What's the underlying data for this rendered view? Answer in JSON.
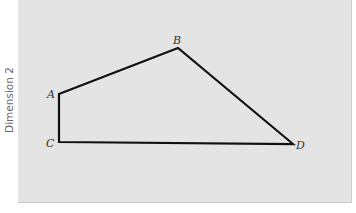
{
  "diagram": {
    "y_axis_label": "Dimension 2",
    "stroke_color": "#111111",
    "panel_color": "#e4e4e4",
    "points": [
      {
        "id": "A",
        "label": "A",
        "x": 59,
        "y": 94
      },
      {
        "id": "B",
        "label": "B",
        "x": 178,
        "y": 48
      },
      {
        "id": "C",
        "label": "C",
        "x": 59,
        "y": 142
      },
      {
        "id": "D",
        "label": "D",
        "x": 293,
        "y": 144
      }
    ],
    "edges": [
      [
        "C",
        "A"
      ],
      [
        "A",
        "B"
      ],
      [
        "B",
        "D"
      ],
      [
        "D",
        "C"
      ]
    ]
  }
}
